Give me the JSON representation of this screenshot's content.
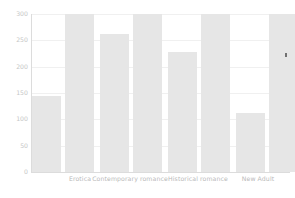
{
  "chart_data": {
    "type": "bar",
    "title": "",
    "subtitle": "",
    "xlabel": "",
    "ylabel": "",
    "ylim": [
      0,
      300
    ],
    "yticks": [
      0,
      50,
      100,
      150,
      200,
      250,
      300
    ],
    "ytick_labels": [
      "0",
      "50",
      "100",
      "150",
      "200",
      "250",
      "300"
    ],
    "grid": true,
    "legend": "none",
    "categories": [
      "Erotica",
      "Contemporary romance",
      "Historical romance",
      "New Adult"
    ],
    "series": [
      {
        "name": "series-1",
        "values": [
          145,
          263,
          228,
          113
        ]
      },
      {
        "name": "series-2",
        "values": [
          300,
          300,
          300,
          300
        ]
      }
    ],
    "bars_flat": [
      {
        "label": "Erotica",
        "series": "series-1",
        "value": 145
      },
      {
        "label": "Erotica",
        "series": "series-2",
        "value": 300
      },
      {
        "label": "Contemporary romance",
        "series": "series-1",
        "value": 263
      },
      {
        "label": "Contemporary romance",
        "series": "series-2",
        "value": 300
      },
      {
        "label": "Historical romance",
        "series": "series-1",
        "value": 228
      },
      {
        "label": "Historical romance",
        "series": "series-2",
        "value": 300
      },
      {
        "label": "New Adult",
        "series": "series-1",
        "value": 113
      },
      {
        "label": "New Adult",
        "series": "series-2",
        "value": 300
      }
    ],
    "colors": {
      "bar": "#e6e6e6",
      "gridline": "#f0f0f0",
      "axis": "#dcdcdc",
      "tick_text": "#c6c6c6",
      "label_text": "#b9b9b9",
      "background": "#ffffff"
    },
    "annotations": [
      {
        "name": "stray-mark",
        "x_value": "New Adult",
        "y_value": 255,
        "text": ""
      }
    ]
  }
}
